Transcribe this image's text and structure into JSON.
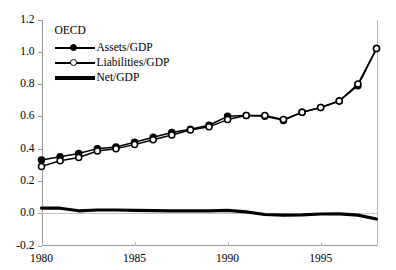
{
  "chart_data": {
    "type": "line",
    "title": "",
    "xlabel": "",
    "ylabel": "",
    "xlim": [
      1980,
      1998
    ],
    "ylim": [
      -0.2,
      1.2
    ],
    "grid": false,
    "legend_position": "top-left",
    "legend_title": "OECD",
    "x": [
      1980,
      1981,
      1982,
      1983,
      1984,
      1985,
      1986,
      1987,
      1988,
      1989,
      1990,
      1991,
      1992,
      1993,
      1994,
      1995,
      1996,
      1997,
      1998
    ],
    "xticks": [
      1980,
      1985,
      1990,
      1995
    ],
    "xticklabels": [
      "1980",
      "1985",
      "1990",
      "1995"
    ],
    "yticks": [
      -0.2,
      0.0,
      0.2,
      0.4,
      0.6,
      0.8,
      1.0,
      1.2
    ],
    "yticklabels": [
      "-0.2",
      "0.0",
      "0.2",
      "0.4",
      "0.6",
      "0.8",
      "1.0",
      "1.2"
    ],
    "series": [
      {
        "name": "Assets/GDP",
        "marker": "filled-circle",
        "color": "#000000",
        "values": [
          0.33,
          0.35,
          0.37,
          0.4,
          0.41,
          0.44,
          0.47,
          0.5,
          0.52,
          0.545,
          0.6,
          0.605,
          0.6,
          0.575,
          0.625,
          0.655,
          0.695,
          0.79,
          1.02
        ]
      },
      {
        "name": "Liabilities/GDP",
        "marker": "open-circle",
        "color": "#000000",
        "values": [
          0.29,
          0.325,
          0.345,
          0.385,
          0.4,
          0.425,
          0.455,
          0.485,
          0.515,
          0.535,
          0.58,
          0.605,
          0.605,
          0.58,
          0.625,
          0.655,
          0.695,
          0.8,
          1.02
        ]
      },
      {
        "name": "Net/GDP",
        "marker": "none",
        "color": "#000000",
        "values": [
          0.032,
          0.031,
          0.015,
          0.02,
          0.02,
          0.018,
          0.016,
          0.014,
          0.014,
          0.015,
          0.018,
          0.008,
          -0.008,
          -0.012,
          -0.01,
          -0.005,
          -0.004,
          -0.012,
          -0.036
        ]
      }
    ]
  },
  "legend": {
    "title": "OECD",
    "entries": [
      {
        "label": "Assets/GDP"
      },
      {
        "label": "Liabilities/GDP"
      },
      {
        "label": "Net/GDP"
      }
    ]
  }
}
